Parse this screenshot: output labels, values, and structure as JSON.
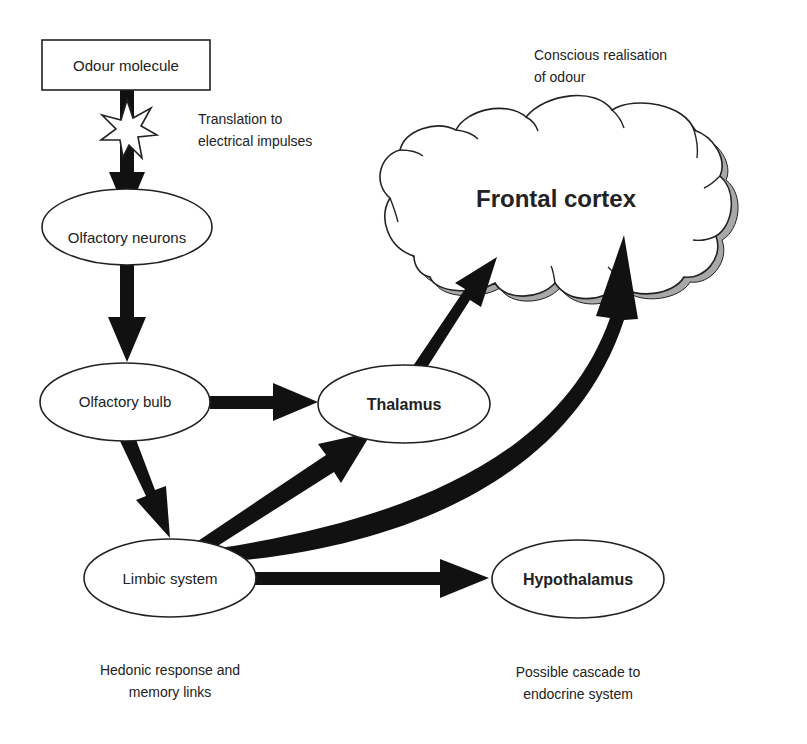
{
  "nodes": {
    "odour_molecule": {
      "label": "Odour molecule"
    },
    "olfactory_neurons": {
      "label": "Olfactory neurons"
    },
    "olfactory_bulb": {
      "label": "Olfactory bulb"
    },
    "thalamus": {
      "label": "Thalamus"
    },
    "limbic_system": {
      "label": "Limbic system"
    },
    "hypothalamus": {
      "label": "Hypothalamus"
    },
    "frontal_cortex": {
      "label": "Frontal cortex"
    }
  },
  "annotations": {
    "translation": [
      "Translation to",
      "electrical impulses"
    ],
    "conscious": [
      "Conscious realisation",
      "of odour"
    ],
    "hedonic": [
      "Hedonic response and",
      "memory links"
    ],
    "cascade": [
      "Possible cascade to",
      "endocrine system"
    ]
  },
  "colors": {
    "arrow": "#111111",
    "outline": "#222222",
    "cloud_shadow": "#a8a8a8",
    "background": "#ffffff"
  }
}
